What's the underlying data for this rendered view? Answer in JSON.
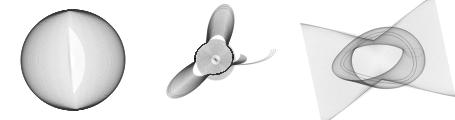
{
  "page": {
    "background_color": "#ffffff",
    "width": 455,
    "height": 120
  },
  "chart_data": {
    "type": "line",
    "title": "",
    "subtitle": "",
    "xlabel": "",
    "ylabel": "",
    "grid": false,
    "legend": false,
    "axes_visible": false,
    "tick_labels": [],
    "annotations": [],
    "stroke_color": "#3a3a3a",
    "figures": [
      {
        "name": "sphere-ring",
        "label": "Figure 1 - Sphere Ring",
        "cx": 73,
        "cy": 60,
        "rx": 52,
        "ry": 50,
        "curve_count": 150,
        "stroke_width": 0.35,
        "stroke_opacity": 0.3,
        "void_cx": 71,
        "void_cy": 60,
        "void_rx": 10,
        "void_ry": 34,
        "tilt_deg": -4,
        "params": {
          "a": 1,
          "b": 1,
          "phase_span": 3.14159,
          "depth": 0.86
        }
      },
      {
        "name": "star-rosette",
        "label": "Figure 2 - Star Rosette",
        "cx": 214,
        "cy": 58,
        "rx": 62,
        "ry": 54,
        "curve_count": 120,
        "stroke_width": 0.3,
        "stroke_opacity": 0.42,
        "points": 5,
        "core_r": 19,
        "tilt_deg": -8,
        "params": {
          "a": 5,
          "b": 2,
          "phase_span": 6.28318,
          "depth": 0.62
        }
      },
      {
        "name": "twisted-torus",
        "label": "Figure 3 - Twisted Torus Band",
        "cx": 378,
        "cy": 60,
        "rx": 68,
        "ry": 52,
        "curve_count": 130,
        "stroke_width": 0.3,
        "stroke_opacity": 0.38,
        "core_rx": 34,
        "core_ry": 22,
        "tilt_deg": -12,
        "params": {
          "a": 2,
          "b": 3,
          "phase_span": 6.28318,
          "depth": 0.72
        }
      }
    ]
  }
}
